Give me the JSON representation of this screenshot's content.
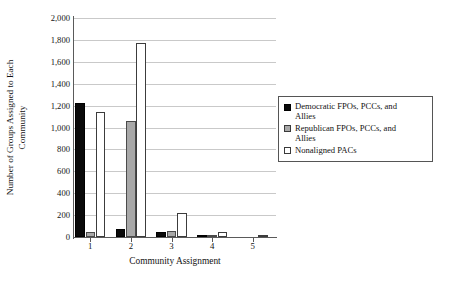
{
  "chart_data": {
    "type": "bar",
    "title": "",
    "xlabel": "Community Assignment",
    "ylabel": "Number of Groups Assigned to Each Community",
    "ylabel_line1": "Number of Groups Assigned to Each",
    "ylabel_line2": "Community",
    "categories": [
      "1",
      "2",
      "3",
      "4",
      "5"
    ],
    "ylim": [
      0,
      2000
    ],
    "ytick_step": 200,
    "ytick_labels": [
      "0",
      "200",
      "400",
      "600",
      "800",
      "1,000",
      "1,200",
      "1,400",
      "1,600",
      "1,800",
      "2,000"
    ],
    "ytick_values": [
      0,
      200,
      400,
      600,
      800,
      1000,
      1200,
      1400,
      1600,
      1800,
      2000
    ],
    "grid": true,
    "grid_axis": "y",
    "legend_position": "right",
    "series": [
      {
        "name": "Democratic FPOs, PCCs, and Allies",
        "name_line1": "Democratic FPOs, PCCs, and",
        "name_line2": "Allies",
        "color": "#0a0a0a",
        "swatch": "dem",
        "values": [
          1224,
          76,
          45,
          8,
          0
        ]
      },
      {
        "name": "Republican FPOs, PCCs, and Allies",
        "name_line1": "Republican FPOs, PCCs, and",
        "name_line2": "Allies",
        "color": "#a8a8a8",
        "swatch": "rep",
        "values": [
          48,
          1060,
          55,
          14,
          0
        ]
      },
      {
        "name": "Nonaligned PACs",
        "name_line1": "Nonaligned PACs",
        "name_line2": "",
        "color": "#ffffff",
        "swatch": "non",
        "values": [
          1141,
          1772,
          220,
          45,
          12
        ]
      }
    ]
  }
}
